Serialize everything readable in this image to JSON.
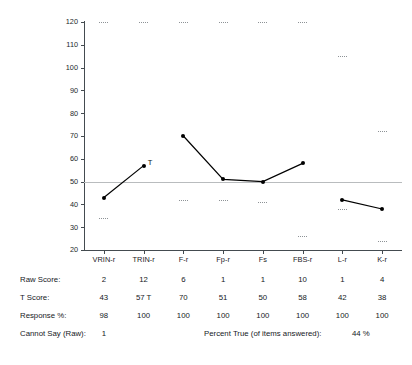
{
  "chart_data": {
    "type": "line",
    "title": "",
    "xlabel": "",
    "ylabel": "",
    "ylim": [
      20,
      120
    ],
    "yticks": [
      120,
      110,
      100,
      90,
      80,
      70,
      60,
      50,
      40,
      30,
      20
    ],
    "grid": false,
    "reference_line": 50,
    "legend": "none",
    "categories": [
      "VRIN-r",
      "TRIN-r",
      "F-r",
      "Fp-r",
      "Fs",
      "FBS-r",
      "L-r",
      "K-r"
    ],
    "series": [
      {
        "name": "T Score",
        "values": [
          43,
          57,
          70,
          51,
          50,
          58,
          42,
          38
        ],
        "segments": [
          [
            0,
            1
          ],
          [
            2,
            3,
            4,
            5
          ],
          [
            6,
            7
          ]
        ]
      }
    ],
    "annotations": [
      {
        "label": "T",
        "category": "TRIN-r",
        "value": 57
      }
    ],
    "percentile_bands": [
      {
        "category": "VRIN-r",
        "upper": 120,
        "lower": 34
      },
      {
        "category": "TRIN-r",
        "upper": 120,
        "lower": null
      },
      {
        "category": "F-r",
        "upper": 120,
        "lower": 42
      },
      {
        "category": "Fp-r",
        "upper": 120,
        "lower": 42
      },
      {
        "category": "Fs",
        "upper": 120,
        "lower": 41
      },
      {
        "category": "FBS-r",
        "upper": 120,
        "lower": 26
      },
      {
        "category": "L-r",
        "upper": 105,
        "lower": 38
      },
      {
        "category": "K-r",
        "upper": 72,
        "lower": 24
      }
    ]
  },
  "table": {
    "rows": [
      {
        "label": "Raw Score:",
        "values": [
          "2",
          "12",
          "6",
          "1",
          "1",
          "10",
          "1",
          "4"
        ]
      },
      {
        "label": "T Score:",
        "values": [
          "43",
          "57 T",
          "70",
          "51",
          "50",
          "58",
          "42",
          "38"
        ]
      },
      {
        "label": "Response %:",
        "values": [
          "98",
          "100",
          "100",
          "100",
          "100",
          "100",
          "100",
          "100"
        ]
      }
    ],
    "cannot_say": {
      "label": "Cannot Say (Raw):",
      "value": "1"
    },
    "percent_true": {
      "label": "Percent True (of items answered):",
      "value": "44 %"
    }
  },
  "colors": {
    "axis": "#444b50",
    "reference_line": "#b9bcbe",
    "series": "#000000",
    "band": "#8d9296",
    "text": "#15191d"
  }
}
